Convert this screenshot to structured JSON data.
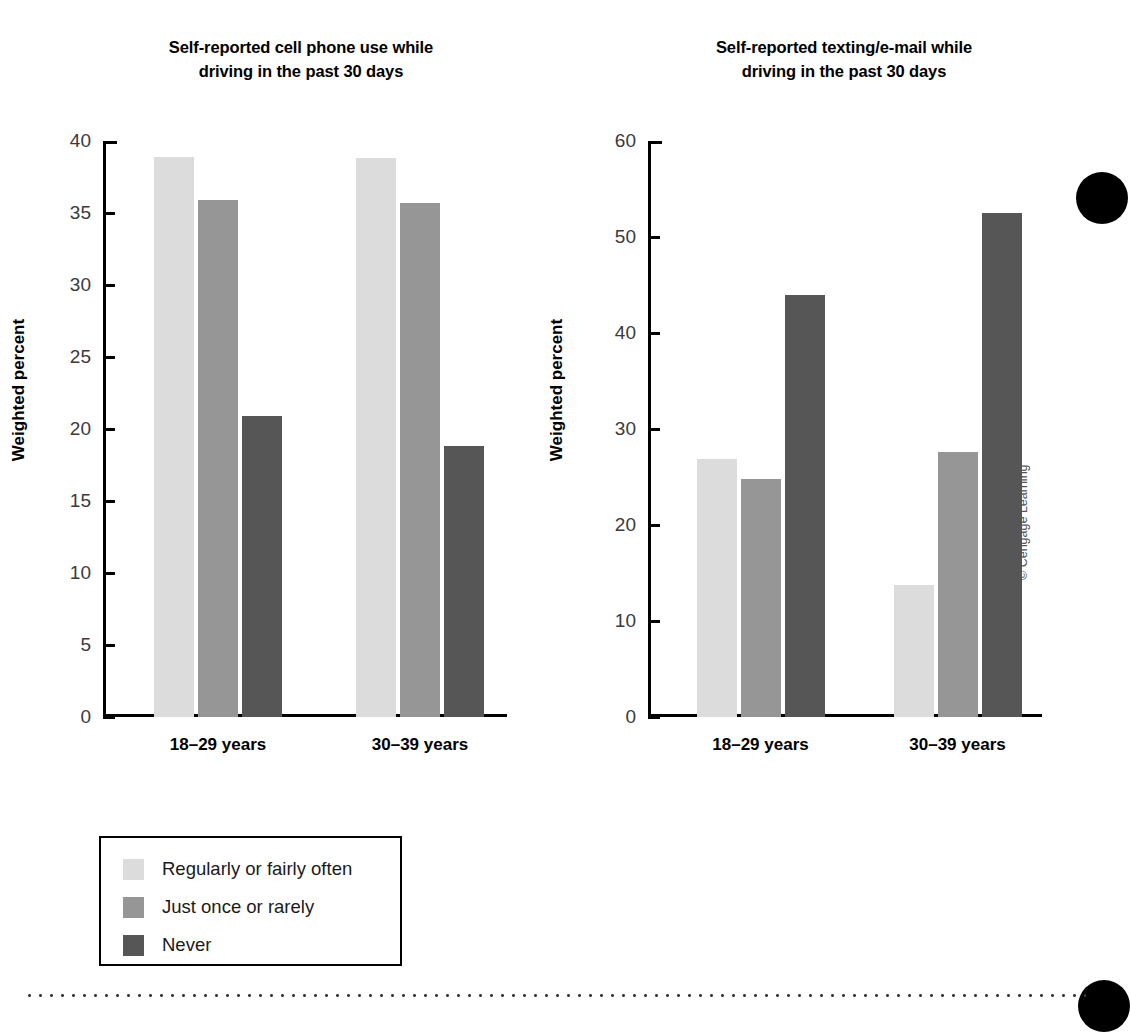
{
  "legend": {
    "items": [
      {
        "label": "Regularly or fairly often",
        "color": "#dcdcdc"
      },
      {
        "label": "Just once or rarely",
        "color": "#969696"
      },
      {
        "label": "Never",
        "color": "#565656"
      }
    ]
  },
  "credit": "© Cengage Learning",
  "chart_data": [
    {
      "type": "bar",
      "id": "cell-phone-use",
      "title": "Self-reported cell phone use while driving in the past 30 days",
      "title_line1": "Self-reported cell phone use while",
      "title_line2": "driving in the past 30 days",
      "xlabel": "",
      "ylabel": "Weighted percent",
      "categories": [
        "18–29 years",
        "30–39 years"
      ],
      "ylim": [
        0,
        40
      ],
      "yticks": [
        0,
        5,
        10,
        15,
        20,
        25,
        30,
        35,
        40
      ],
      "grid": false,
      "legend_position": "below-left",
      "series": [
        {
          "name": "Regularly or fairly often",
          "color": "#dcdcdc",
          "values": [
            38.9,
            38.8
          ]
        },
        {
          "name": "Just once or rarely",
          "color": "#969696",
          "values": [
            35.9,
            35.7
          ]
        },
        {
          "name": "Never",
          "color": "#565656",
          "values": [
            20.9,
            18.8
          ]
        }
      ]
    },
    {
      "type": "bar",
      "id": "texting-email",
      "title": "Self-reported texting/e-mail while driving in the past 30 days",
      "title_line1": "Self-reported texting/e-mail while",
      "title_line2": "driving in the past 30 days",
      "xlabel": "",
      "ylabel": "Weighted percent",
      "categories": [
        "18–29 years",
        "30–39 years"
      ],
      "ylim": [
        0,
        60
      ],
      "yticks": [
        0,
        10,
        20,
        30,
        40,
        50,
        60
      ],
      "grid": false,
      "legend_position": "below-left",
      "series": [
        {
          "name": "Regularly or fairly often",
          "color": "#dcdcdc",
          "values": [
            26.9,
            13.8
          ]
        },
        {
          "name": "Just once or rarely",
          "color": "#969696",
          "values": [
            24.8,
            27.6
          ]
        },
        {
          "name": "Never",
          "color": "#565656",
          "values": [
            44.0,
            52.5
          ]
        }
      ]
    }
  ]
}
